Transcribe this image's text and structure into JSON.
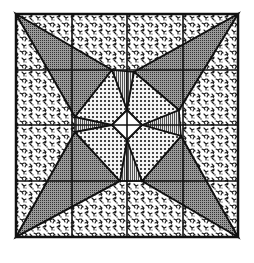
{
  "figure": {
    "caption": "",
    "bounds": {
      "x0": 16,
      "y0": 14,
      "x1": 238,
      "y1": 237
    },
    "grid": {
      "columns": 4,
      "rows": 4,
      "x_lines": [
        16,
        72,
        127,
        183,
        238
      ],
      "y_lines": [
        14,
        70,
        125,
        181,
        237
      ]
    },
    "colors": {
      "background": "#ffffff",
      "ink": "#111111",
      "star_point_fill": "#6e6e6e",
      "kite_fill": "#f2f2f2",
      "center_fill": "#ffffff"
    },
    "textures": {
      "background_field": "leafy-floral-print",
      "star_points": "dense-dot-screen",
      "kites": "checker-grid",
      "center": "plain-white",
      "gaps": "vertical-stripes"
    },
    "regions": {
      "star_points": [
        {
          "name": "top-left",
          "points": "16,14 112,70 75,117"
        },
        {
          "name": "top-right",
          "points": "238,14 179,110 134,72"
        },
        {
          "name": "bottom-left",
          "points": "16,237 75,132 120,181"
        },
        {
          "name": "bottom-right",
          "points": "238,237 142,181 181,136"
        }
      ],
      "kites": [
        {
          "name": "top-left",
          "points": "112,70 127,110 112,125 75,117"
        },
        {
          "name": "top-right",
          "points": "134,72 179,110 142,125 127,110"
        },
        {
          "name": "bottom-left",
          "points": "75,132 112,125 127,140 120,181"
        },
        {
          "name": "bottom-right",
          "points": "142,125 181,136 142,181 127,140"
        }
      ],
      "center_diamond": "127,110 142,125 127,140 112,125",
      "gaps": [
        {
          "name": "top",
          "points": "112,70 134,72 127,110"
        },
        {
          "name": "right",
          "points": "179,110 181,136 142,125"
        },
        {
          "name": "bottom",
          "points": "120,181 142,181 127,140"
        },
        {
          "name": "left",
          "points": "75,117 112,125 75,132"
        }
      ]
    }
  }
}
